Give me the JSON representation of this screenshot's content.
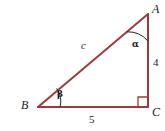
{
  "figure": {
    "type": "right-triangle-diagram",
    "stroke_color": "#a03a3a",
    "label_color": "#1a1a1a",
    "background_color": "#ffffff",
    "vertices": {
      "A": {
        "label": "A",
        "x": 148,
        "y": 14
      },
      "B": {
        "label": "B",
        "x": 38,
        "y": 107
      },
      "C": {
        "label": "C",
        "x": 148,
        "y": 107
      }
    },
    "sides": {
      "hypotenuse": {
        "label": "c",
        "from": "B",
        "to": "A"
      },
      "vertical": {
        "label": "4",
        "from": "A",
        "to": "C"
      },
      "horizontal": {
        "label": "5",
        "from": "B",
        "to": "C"
      }
    },
    "angles": {
      "at_A": {
        "label": "α"
      },
      "at_B": {
        "label": "β"
      },
      "at_C": {
        "label": "right-angle",
        "marker": "square"
      }
    }
  }
}
